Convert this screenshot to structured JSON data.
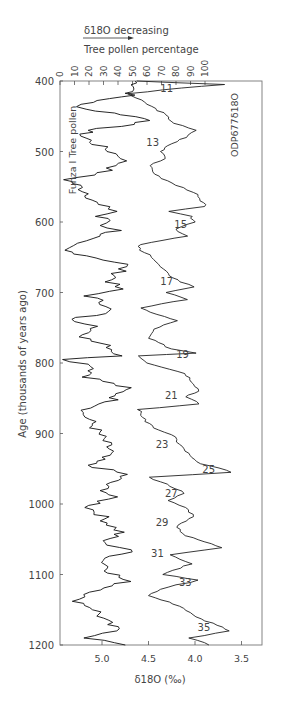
{
  "chart_data": {
    "type": "line",
    "title": "",
    "annotation_top": "δ18O decreasing",
    "top_axis": {
      "label": "Tree pollen percentage",
      "ticks": [
        "0",
        "10",
        "20",
        "30",
        "40",
        "50",
        "60",
        "70",
        "80",
        "90",
        "100"
      ],
      "range": [
        0,
        100
      ]
    },
    "bottom_axis": {
      "label": "δ18O (‰)",
      "ticks": [
        "5.0",
        "4.5",
        "4.0",
        "3.5"
      ],
      "range": [
        5.45,
        3.3
      ],
      "reversed": true
    },
    "y_axis": {
      "label": "Age (thousands of years ago)",
      "ticks": [
        "400",
        "500",
        "600",
        "700",
        "800",
        "900",
        "1000",
        "1100",
        "1200"
      ],
      "range": [
        400,
        1200
      ],
      "inverted": true
    },
    "series": [
      {
        "name": "Funza I Tree pollen",
        "axis": "top",
        "points": [
          [
            400,
            52
          ],
          [
            408,
            53
          ],
          [
            415,
            50
          ],
          [
            420,
            48
          ],
          [
            425,
            35
          ],
          [
            433,
            13
          ],
          [
            440,
            18
          ],
          [
            448,
            45
          ],
          [
            456,
            65
          ],
          [
            470,
            20
          ],
          [
            478,
            15
          ],
          [
            490,
            25
          ],
          [
            500,
            35
          ],
          [
            510,
            45
          ],
          [
            520,
            40
          ],
          [
            530,
            28
          ],
          [
            540,
            5
          ],
          [
            548,
            12
          ],
          [
            560,
            20
          ],
          [
            575,
            25
          ],
          [
            585,
            40
          ],
          [
            592,
            25
          ],
          [
            598,
            35
          ],
          [
            605,
            30
          ],
          [
            612,
            40
          ],
          [
            620,
            25
          ],
          [
            630,
            8
          ],
          [
            640,
            2
          ],
          [
            648,
            20
          ],
          [
            660,
            45
          ],
          [
            673,
            40
          ],
          [
            685,
            35
          ],
          [
            695,
            40
          ],
          [
            705,
            20
          ],
          [
            720,
            35
          ],
          [
            730,
            30
          ],
          [
            738,
            5
          ],
          [
            748,
            30
          ],
          [
            760,
            12
          ],
          [
            775,
            35
          ],
          [
            790,
            40
          ],
          [
            795,
            5
          ],
          [
            805,
            25
          ],
          [
            820,
            20
          ],
          [
            835,
            45
          ],
          [
            855,
            35
          ],
          [
            870,
            15
          ],
          [
            880,
            20
          ],
          [
            895,
            25
          ],
          [
            910,
            30
          ],
          [
            925,
            35
          ],
          [
            945,
            20
          ],
          [
            958,
            45
          ],
          [
            975,
            30
          ],
          [
            990,
            35
          ],
          [
            1005,
            20
          ],
          [
            1015,
            28
          ],
          [
            1030,
            35
          ],
          [
            1040,
            42
          ],
          [
            1055,
            28
          ],
          [
            1065,
            50
          ],
          [
            1080,
            30
          ],
          [
            1095,
            35
          ],
          [
            1110,
            45
          ],
          [
            1125,
            25
          ],
          [
            1135,
            10
          ],
          [
            1150,
            25
          ],
          [
            1165,
            30
          ],
          [
            1180,
            40
          ],
          [
            1190,
            20
          ],
          [
            1200,
            45
          ]
        ]
      },
      {
        "name": "ODP677 δ18O",
        "axis": "bottom",
        "points": [
          [
            400,
            4.62
          ],
          [
            405,
            3.7
          ],
          [
            410,
            4.15
          ],
          [
            418,
            4.72
          ],
          [
            430,
            4.55
          ],
          [
            445,
            4.35
          ],
          [
            460,
            4.22
          ],
          [
            470,
            4.0
          ],
          [
            480,
            4.1
          ],
          [
            492,
            4.3
          ],
          [
            500,
            4.35
          ],
          [
            510,
            4.3
          ],
          [
            520,
            4.5
          ],
          [
            535,
            4.4
          ],
          [
            548,
            4.2
          ],
          [
            558,
            4.0
          ],
          [
            570,
            3.95
          ],
          [
            578,
            3.88
          ],
          [
            585,
            4.3
          ],
          [
            592,
            4.05
          ],
          [
            600,
            4.0
          ],
          [
            610,
            4.2
          ],
          [
            620,
            4.1
          ],
          [
            632,
            4.6
          ],
          [
            640,
            4.6
          ],
          [
            650,
            4.45
          ],
          [
            660,
            4.4
          ],
          [
            673,
            4.3
          ],
          [
            685,
            4.15
          ],
          [
            692,
            4.0
          ],
          [
            700,
            4.3
          ],
          [
            710,
            4.1
          ],
          [
            722,
            4.6
          ],
          [
            740,
            4.2
          ],
          [
            752,
            4.45
          ],
          [
            765,
            4.5
          ],
          [
            780,
            4.25
          ],
          [
            786,
            3.98
          ],
          [
            790,
            4.6
          ],
          [
            800,
            4.5
          ],
          [
            815,
            4.1
          ],
          [
            830,
            4.0
          ],
          [
            840,
            3.95
          ],
          [
            848,
            4.1
          ],
          [
            858,
            3.95
          ],
          [
            866,
            4.6
          ],
          [
            880,
            4.55
          ],
          [
            895,
            4.4
          ],
          [
            905,
            4.2
          ],
          [
            912,
            4.2
          ],
          [
            925,
            4.1
          ],
          [
            940,
            4.0
          ],
          [
            955,
            3.6
          ],
          [
            962,
            4.5
          ],
          [
            975,
            4.25
          ],
          [
            985,
            4.1
          ],
          [
            995,
            4.3
          ],
          [
            1005,
            4.1
          ],
          [
            1018,
            4.0
          ],
          [
            1030,
            4.2
          ],
          [
            1045,
            4.1
          ],
          [
            1062,
            3.7
          ],
          [
            1072,
            4.25
          ],
          [
            1085,
            4.05
          ],
          [
            1100,
            4.35
          ],
          [
            1108,
            3.95
          ],
          [
            1118,
            4.3
          ],
          [
            1130,
            4.5
          ],
          [
            1145,
            4.15
          ],
          [
            1160,
            4.0
          ],
          [
            1172,
            3.75
          ],
          [
            1180,
            3.65
          ],
          [
            1190,
            4.05
          ],
          [
            1200,
            3.85
          ]
        ]
      }
    ],
    "stage_labels": [
      {
        "text": "11",
        "age": 410
      },
      {
        "text": "13",
        "age": 487
      },
      {
        "text": "15",
        "age": 603
      },
      {
        "text": "17",
        "age": 684
      },
      {
        "text": "19",
        "age": 787
      },
      {
        "text": "21",
        "age": 845
      },
      {
        "text": "23",
        "age": 915
      },
      {
        "text": "25",
        "age": 950
      },
      {
        "text": "27",
        "age": 985
      },
      {
        "text": "29",
        "age": 1026
      },
      {
        "text": "31",
        "age": 1070
      },
      {
        "text": "33",
        "age": 1110
      },
      {
        "text": "35",
        "age": 1175
      }
    ],
    "legend": [
      "Funza I Tree pollen",
      "ODP677δ18O"
    ],
    "grid": false
  }
}
